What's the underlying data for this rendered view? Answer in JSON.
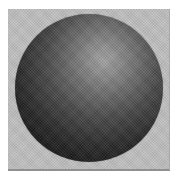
{
  "scene": {
    "description": "Grayscale rendering of a dark shaded sphere lit from the upper right, on a light gray square backdrop with white page margins",
    "page_background": "#ffffff",
    "panel": {
      "background": "#c0c0c0",
      "edge_color": "#a8a8a8",
      "bottom_shadow_color": "#8f8f8f"
    },
    "sphere": {
      "highlight_color": "#a2a2a2",
      "mid_color": "#4a4a4a",
      "edge_color": "#0d0d0d",
      "highlight_position": "60% 31%"
    }
  }
}
